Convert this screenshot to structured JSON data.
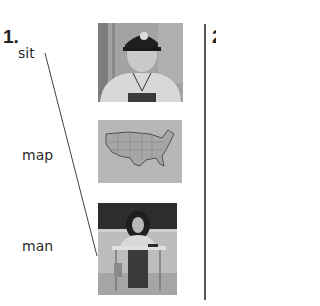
{
  "exercise": {
    "number": "1.",
    "next_number_partial": "2",
    "words": [
      {
        "label": "sit"
      },
      {
        "label": "map"
      },
      {
        "label": "man"
      }
    ],
    "images": [
      {
        "name": "man-in-cap-photo",
        "description": "man wearing a baseball cap"
      },
      {
        "name": "us-map-image",
        "description": "map of the United States"
      },
      {
        "name": "girl-sitting-at-desk-photo",
        "description": "girl sitting at a school desk"
      }
    ],
    "connections": [
      {
        "from": "sit",
        "to": "girl-sitting-at-desk-photo"
      }
    ]
  },
  "colors": {
    "text": "#222222",
    "line": "#444444",
    "photo_bg": "#8a8a8a",
    "map_bg": "#b5b5b5"
  }
}
